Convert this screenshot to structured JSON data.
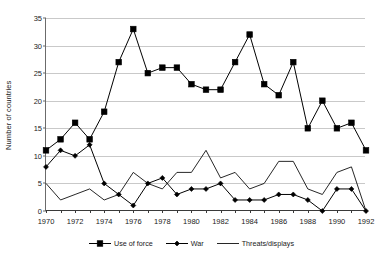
{
  "chart_data": {
    "type": "line",
    "title": "",
    "xlabel": "",
    "ylabel": "Number of countries",
    "x": [
      1970,
      1971,
      1972,
      1973,
      1974,
      1975,
      1976,
      1977,
      1978,
      1979,
      1980,
      1981,
      1982,
      1983,
      1984,
      1985,
      1986,
      1987,
      1988,
      1989,
      1990,
      1991,
      1992
    ],
    "xtick_labels": [
      "1970",
      "1972",
      "1974",
      "1976",
      "1978",
      "1980",
      "1982",
      "1984",
      "1986",
      "1988",
      "1990",
      "1992"
    ],
    "xtick_values": [
      1970,
      1972,
      1974,
      1976,
      1978,
      1980,
      1982,
      1984,
      1986,
      1988,
      1990,
      1992
    ],
    "ytick_labels": [
      "0",
      "5",
      "10",
      "15",
      "20",
      "25",
      "30",
      "35"
    ],
    "ytick_values": [
      0,
      5,
      10,
      15,
      20,
      25,
      30,
      35
    ],
    "ylim": [
      0,
      35
    ],
    "xlim": [
      1970,
      1992
    ],
    "grid": "horizontal",
    "legend_position": "bottom",
    "series": [
      {
        "name": "Use of force",
        "marker": "square",
        "color": "#000000",
        "values": [
          11,
          13,
          16,
          13,
          18,
          27,
          33,
          25,
          26,
          26,
          23,
          22,
          22,
          27,
          32,
          23,
          21,
          27,
          15,
          20,
          15,
          16,
          11
        ]
      },
      {
        "name": "War",
        "marker": "diamond",
        "color": "#000000",
        "values": [
          8,
          11,
          10,
          12,
          5,
          3,
          1,
          5,
          6,
          3,
          4,
          4,
          5,
          2,
          2,
          2,
          3,
          3,
          2,
          0,
          4,
          4,
          0
        ]
      },
      {
        "name": "Threats/displays",
        "marker": "none",
        "color": "#000000",
        "values": [
          5,
          2,
          3,
          4,
          2,
          3,
          7,
          5,
          4,
          7,
          7,
          11,
          6,
          7,
          4,
          5,
          9,
          9,
          4,
          3,
          7,
          8,
          0
        ]
      }
    ]
  },
  "colors": {
    "gridline": "#c9c9c9",
    "axis": "#3a3a3a",
    "text": "#1a1a1a",
    "background": "#ffffff"
  }
}
